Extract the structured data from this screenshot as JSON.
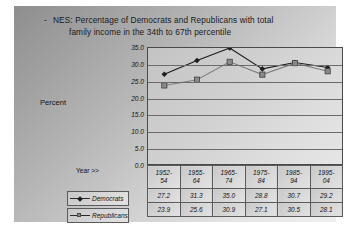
{
  "slide": {
    "bullet": "-",
    "title_line1": "NES:  Percentage of Democrats and Republicans with total",
    "title_line2": "family income in the 34th to 67th percentile"
  },
  "labels": {
    "percent_axis": "Percent",
    "year_axis": "Year >>"
  },
  "colors": {
    "democrats_line": "#1c1c1c",
    "republicans_line": "#808080",
    "plot_border": "#4a4a4a",
    "gridline": "#6b6b6b"
  },
  "chart_data": {
    "type": "line",
    "title": "NES:  Percentage of Democrats and Republicans with total family income in the 34th to 67th percentile",
    "xlabel": "Year >>",
    "ylabel": "Percent",
    "ylim": [
      0.0,
      35.0
    ],
    "ytick_labels": [
      "35.0",
      "30.0",
      "25.0",
      "20.0",
      "15.0",
      "10.0",
      "5.0",
      "0.0"
    ],
    "ytick_values": [
      35.0,
      30.0,
      25.0,
      20.0,
      15.0,
      10.0,
      5.0,
      0.0
    ],
    "grid": true,
    "legend_position": "table-left",
    "categories": [
      "1952-54",
      "1955-64",
      "1965-74",
      "1975-84",
      "1985-94",
      "1995-04"
    ],
    "category_lines": [
      [
        "1952-",
        "54"
      ],
      [
        "1955-",
        "64"
      ],
      [
        "1965-",
        "74"
      ],
      [
        "1975-",
        "84"
      ],
      [
        "1985-",
        "94"
      ],
      [
        "1995-",
        "04"
      ]
    ],
    "series": [
      {
        "name": "Democrats",
        "marker": "diamond",
        "values": [
          27.2,
          31.3,
          35.0,
          28.8,
          30.7,
          29.2
        ]
      },
      {
        "name": "Republicans",
        "marker": "square",
        "values": [
          23.9,
          25.6,
          30.9,
          27.1,
          30.5,
          28.1
        ]
      }
    ]
  }
}
